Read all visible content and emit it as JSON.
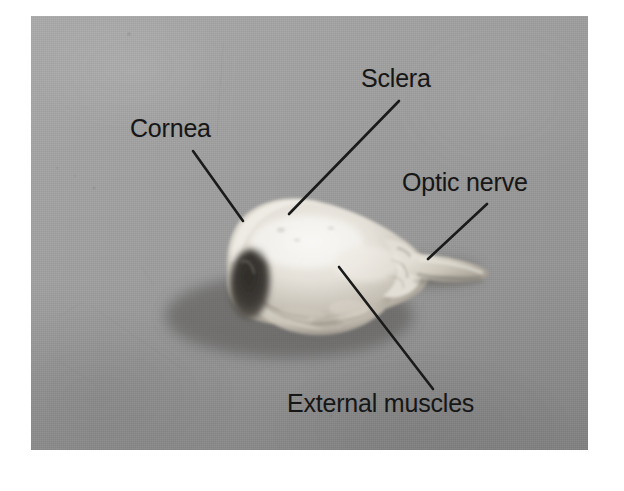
{
  "figure": {
    "kind": "annotated-photograph",
    "caption": "",
    "photo_background_color": "#9c9c9c",
    "label_color": "#161616",
    "leader_line_color": "#1a1a1a",
    "page_background_color": "#ffffff"
  },
  "annotations": [
    {
      "id": "cornea",
      "label": "Cornea",
      "points_to": "dark cornea region at left of specimen",
      "leader": {
        "x1": 193,
        "y1": 151,
        "x2": 243,
        "y2": 221
      }
    },
    {
      "id": "sclera",
      "label": "Sclera",
      "points_to": "white sclera on upper body of specimen",
      "leader": {
        "x1": 399,
        "y1": 101,
        "x2": 289,
        "y2": 214
      }
    },
    {
      "id": "optic-nerve",
      "label": "Optic nerve",
      "points_to": "nerve stalk projecting to the right",
      "leader": {
        "x1": 487,
        "y1": 204,
        "x2": 428,
        "y2": 259
      }
    },
    {
      "id": "external-muscles",
      "label": "External muscles",
      "points_to": "ragged tissue on lower body of specimen",
      "leader": {
        "x1": 339,
        "y1": 267,
        "x2": 433,
        "y2": 389
      }
    }
  ],
  "specimen": {
    "parts": [
      {
        "name": "cornea",
        "tone": "dark"
      },
      {
        "name": "sclera",
        "tone": "white"
      },
      {
        "name": "external-muscles",
        "tone": "off-white"
      },
      {
        "name": "optic-nerve",
        "tone": "light-gray"
      }
    ]
  }
}
